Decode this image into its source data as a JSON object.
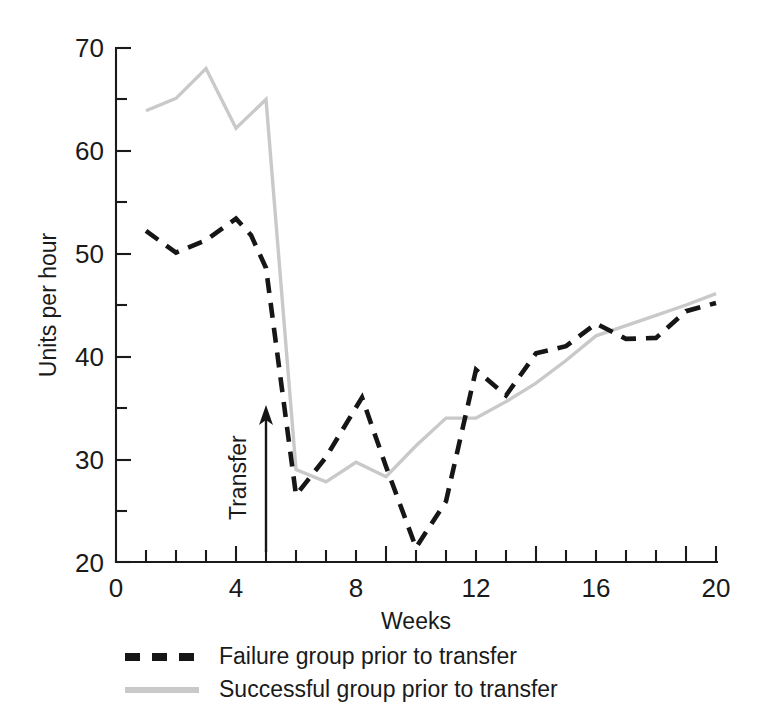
{
  "chart_data": {
    "type": "line",
    "title": "",
    "xlabel": "Weeks",
    "ylabel": "Units per hour",
    "xlim": [
      0,
      20
    ],
    "ylim": [
      20,
      70
    ],
    "x_ticks_labeled": [
      0,
      4,
      8,
      12,
      16,
      20
    ],
    "x_tick_interval": 1,
    "y_ticks_labeled": [
      20,
      30,
      40,
      50,
      60,
      70
    ],
    "y_tick_interval": 5,
    "grid": false,
    "legend_position": "below-left",
    "annotations": [
      {
        "name": "transfer-marker",
        "text": "Transfer",
        "x": 5,
        "arrow_from_y": 21.0,
        "arrow_to_y": 36.8,
        "orientation": "vertical-up"
      }
    ],
    "series": [
      {
        "name": "Failure group prior to transfer",
        "style": "dashed",
        "color": "#161616",
        "x": [
          1,
          2,
          3,
          4,
          4.5,
          5,
          6,
          7,
          8.2,
          9,
          10,
          11,
          12,
          13,
          14,
          15,
          16,
          17,
          18,
          19,
          20
        ],
        "values": [
          52.2,
          50.1,
          51.3,
          53.4,
          51.8,
          48.6,
          26.5,
          30.2,
          36.0,
          29.3,
          21.4,
          25.9,
          38.7,
          36.2,
          40.3,
          41.0,
          43.2,
          41.7,
          41.8,
          44.4,
          45.2
        ]
      },
      {
        "name": "Successful group prior to transfer",
        "style": "solid",
        "color": "#c9c9c9",
        "x": [
          1,
          2,
          3,
          4,
          5,
          6,
          7,
          8,
          9,
          10,
          11,
          12,
          13,
          14,
          15,
          16,
          17,
          18,
          19,
          20
        ],
        "values": [
          63.9,
          65.1,
          68.0,
          62.2,
          65.0,
          29.0,
          27.8,
          29.7,
          28.3,
          31.3,
          34.0,
          34.0,
          35.6,
          37.4,
          39.6,
          42.0,
          43.0,
          44.0,
          45.0,
          46.1
        ]
      }
    ]
  },
  "axes": {
    "y_label": "Units per hour",
    "x_label": "Weeks",
    "y_tick_labels": [
      "70",
      "60",
      "50",
      "40",
      "30",
      "20"
    ],
    "x_tick_labels": [
      "0",
      "4",
      "8",
      "12",
      "16",
      "20"
    ]
  },
  "annotation": {
    "transfer_label": "Transfer"
  },
  "legend": {
    "items": [
      {
        "label": "Failure group prior to transfer",
        "style": "dashed",
        "color": "#161616"
      },
      {
        "label": "Successful group prior to transfer",
        "style": "solid",
        "color": "#c9c9c9"
      }
    ]
  }
}
